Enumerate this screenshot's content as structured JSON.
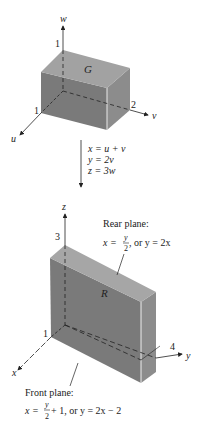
{
  "top_figure": {
    "region_label": "G",
    "axes": {
      "vertical": {
        "name": "w",
        "tick": "1"
      },
      "right": {
        "name": "v",
        "tick": "2"
      },
      "left": {
        "name": "u",
        "tick": "1"
      }
    }
  },
  "transformation": {
    "eq1": "x = u + v",
    "eq2": "y = 2v",
    "eq3": "z = 3w"
  },
  "bottom_figure": {
    "region_label": "R",
    "axes": {
      "vertical": {
        "name": "z",
        "tick": "3"
      },
      "right": {
        "name": "y",
        "tick": "4"
      },
      "left": {
        "name": "x",
        "tick": "1"
      }
    },
    "rear_plane": {
      "title": "Rear plane:",
      "lhs": "x = ",
      "frac_num": "y",
      "frac_den": "2",
      "rest": ", or y = 2x"
    },
    "front_plane": {
      "title": "Front plane:",
      "lhs": "x = ",
      "frac_num": "y",
      "frac_den": "2",
      "rest": " + 1, or y = 2x − 2"
    }
  },
  "colors": {
    "top_face": "#a2a2a2",
    "front_face": "#7a7a7a",
    "side_face": "#8c8c8c",
    "line": "#222222"
  }
}
